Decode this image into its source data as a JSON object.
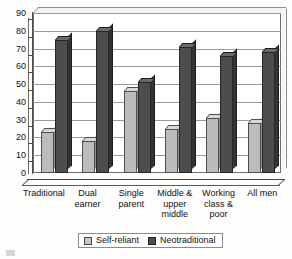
{
  "chart_data": {
    "type": "bar",
    "title": "",
    "subtitle": "",
    "xlabel": "",
    "ylabel": "",
    "ylim": [
      0,
      90
    ],
    "ytick_step": 10,
    "yticks": [
      90,
      80,
      70,
      60,
      50,
      40,
      30,
      20,
      10,
      0
    ],
    "grid": true,
    "legend_position": "bottom",
    "categories": [
      "Traditional",
      "Dual earner",
      "Single parent",
      "Middle & upper middle",
      "Working class & poor",
      "All men"
    ],
    "category_lines": [
      [
        "Traditional"
      ],
      [
        "Dual",
        "earner"
      ],
      [
        "Single",
        "parent"
      ],
      [
        "Middle &",
        "upper",
        "middle"
      ],
      [
        "Working",
        "class &",
        "poor"
      ],
      [
        "All men"
      ]
    ],
    "series": [
      {
        "name": "Self-reliant",
        "color": "#bcbcbc",
        "values": [
          23,
          18,
          46,
          25,
          31,
          28
        ]
      },
      {
        "name": "Neotraditional",
        "color": "#4d4d4d",
        "values": [
          75,
          80,
          51,
          71,
          66,
          68
        ]
      }
    ]
  },
  "legend": {
    "items": [
      {
        "label": "Self-reliant",
        "swatch": "light"
      },
      {
        "label": "Neotraditional",
        "swatch": "dark"
      }
    ]
  },
  "colors": {
    "self_reliant": "#bcbcbc",
    "neotraditional": "#4d4d4d",
    "axis": "#4a4a4a",
    "grid": "#9a9a9a",
    "background": "#fdfdfb"
  }
}
